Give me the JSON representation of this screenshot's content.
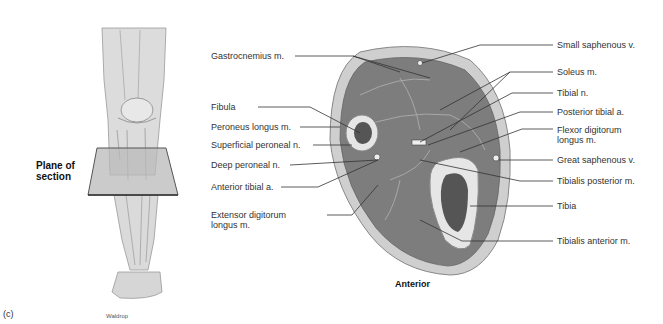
{
  "figure": {
    "panel_label": "(c)",
    "credit": "Waldrop",
    "plane_label_line1": "Plane of",
    "plane_label_line2": "section",
    "orientation_label": "Anterior"
  },
  "labels_left": [
    {
      "text": "Gastrocnemius m."
    },
    {
      "text": "Fibula"
    },
    {
      "text": "Peroneus longus m."
    },
    {
      "text": "Superficial peroneal n."
    },
    {
      "text": "Deep peroneal n."
    },
    {
      "text": "Anterior tibial a."
    },
    {
      "text": "Extensor digitorum",
      "text2": "longus m."
    }
  ],
  "labels_right": [
    {
      "text": "Small saphenous v."
    },
    {
      "text": "Soleus m."
    },
    {
      "text": "Tibial n."
    },
    {
      "text": "Posterior tibial a."
    },
    {
      "text": "Flexor digitorum",
      "text2": "longus m."
    },
    {
      "text": "Great saphenous v."
    },
    {
      "text": "Tibialis posterior m."
    },
    {
      "text": "Tibia"
    },
    {
      "text": "Tibialis anterior m."
    }
  ],
  "colors": {
    "muscle": "#7d7d7d",
    "skin": "#c9c9c9",
    "bone": "#e6e6e6",
    "marrow": "#555555",
    "leg": "#d8d8d8"
  }
}
